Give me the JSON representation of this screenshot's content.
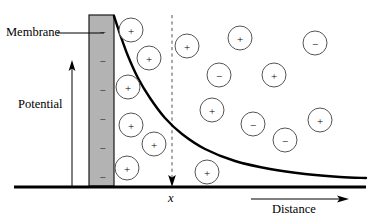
{
  "labels": {
    "membrane": "Membrane",
    "potential": "Potential",
    "distance": "Distance",
    "x_marker": "x"
  },
  "colors": {
    "membrane_fill": "#b3b3b3",
    "membrane_stroke": "#1a1a1a",
    "ion_stroke": "#555555",
    "axis": "#000000",
    "curve": "#000000",
    "dashed_line": "#555555",
    "background": "#ffffff"
  },
  "membrane": {
    "x": 89,
    "y": 15,
    "width": 25,
    "height": 171,
    "charge_symbol": "−",
    "charge_count": 6,
    "charge_y_positions": [
      32,
      61,
      90,
      119,
      148,
      177
    ]
  },
  "axes": {
    "baseline": {
      "x1": 14,
      "y1": 187,
      "x2": 366,
      "y2": 187
    },
    "potential_arrow": {
      "x": 72,
      "y_bottom": 186,
      "y_top": 62
    },
    "distance_arrow": {
      "x1": 251,
      "x2": 348,
      "y": 199
    },
    "dashed_marker": {
      "x": 172,
      "y_top": 15,
      "y_bottom": 186
    }
  },
  "leader_line": {
    "x1": 57,
    "y1": 33,
    "x2": 104,
    "y2": 33
  },
  "chart_data": {
    "type": "line",
    "xlabel": "Distance",
    "ylabel": "Potential",
    "annotations": [
      "Membrane",
      "x"
    ],
    "grid": false,
    "legend": null,
    "curve_points": [
      [
        114,
        16
      ],
      [
        120,
        34
      ],
      [
        128,
        56
      ],
      [
        138,
        78
      ],
      [
        150,
        98
      ],
      [
        165,
        118
      ],
      [
        182,
        134
      ],
      [
        205,
        149
      ],
      [
        235,
        161
      ],
      [
        270,
        169
      ],
      [
        305,
        174
      ],
      [
        340,
        177
      ],
      [
        366,
        178
      ]
    ]
  },
  "ions": [
    {
      "sign": "+",
      "cx": 131,
      "cy": 30,
      "r": 12
    },
    {
      "sign": "+",
      "cx": 149,
      "cy": 58,
      "r": 12
    },
    {
      "sign": "+",
      "cx": 128,
      "cy": 87,
      "r": 12
    },
    {
      "sign": "+",
      "cx": 131,
      "cy": 125,
      "r": 12
    },
    {
      "sign": "+",
      "cx": 154,
      "cy": 144,
      "r": 12
    },
    {
      "sign": "+",
      "cx": 127,
      "cy": 168,
      "r": 12
    },
    {
      "sign": "+",
      "cx": 187,
      "cy": 46,
      "r": 12
    },
    {
      "sign": "−",
      "cx": 219,
      "cy": 75,
      "r": 12
    },
    {
      "sign": "+",
      "cx": 212,
      "cy": 110,
      "r": 12
    },
    {
      "sign": "+",
      "cx": 207,
      "cy": 172,
      "r": 12
    },
    {
      "sign": "+",
      "cx": 240,
      "cy": 38,
      "r": 12
    },
    {
      "sign": "+",
      "cx": 274,
      "cy": 75,
      "r": 12
    },
    {
      "sign": "−",
      "cx": 315,
      "cy": 43,
      "r": 12
    },
    {
      "sign": "−",
      "cx": 253,
      "cy": 124,
      "r": 12
    },
    {
      "sign": "−",
      "cx": 285,
      "cy": 140,
      "r": 12
    },
    {
      "sign": "+",
      "cx": 320,
      "cy": 120,
      "r": 12
    }
  ]
}
